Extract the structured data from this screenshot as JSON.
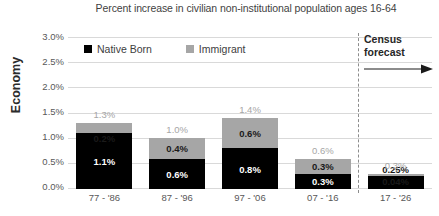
{
  "chart_data": {
    "type": "bar",
    "title": "Percent increase in civilian non-institutional population ages 16-64",
    "xlabel": "",
    "ylabel": "Economy",
    "ylim": [
      0,
      3.0
    ],
    "ytick_labels": [
      "3.0%",
      "2.5%",
      "2.0%",
      "1.5%",
      "1.0%",
      "0.5%",
      "0.0%"
    ],
    "ytick_values": [
      3.0,
      2.5,
      2.0,
      1.5,
      1.0,
      0.5,
      0.0
    ],
    "grid": true,
    "stacked": true,
    "legend_position": "top-left-inside",
    "categories": [
      "77 - '86",
      "87 - '96",
      "97 - '06",
      "07 - '16",
      "17 - '26"
    ],
    "series": [
      {
        "name": "Native Born",
        "color": "#000000",
        "values": [
          1.1,
          0.6,
          0.8,
          0.3,
          0.25
        ],
        "labels": [
          "1.1%",
          "0.6%",
          "0.8%",
          "0.3%",
          "0.25%"
        ]
      },
      {
        "name": "Immigrant",
        "color": "#a6a6a6",
        "values": [
          0.2,
          0.4,
          0.6,
          0.3,
          0.04
        ],
        "labels": [
          "0.2%",
          "0.4%",
          "0.6%",
          "0.3%",
          "0.04%"
        ]
      }
    ],
    "totals": [
      1.3,
      1.0,
      1.4,
      0.6,
      0.3
    ],
    "total_labels": [
      "1.3%",
      "1.0%",
      "1.4%",
      "0.6%",
      "0.3%"
    ],
    "annotations": [
      {
        "name": "census-forecast",
        "line1": "Census",
        "line2": "forecast",
        "arrow": "right-arrow",
        "at_category_index": 4
      }
    ]
  },
  "legend": {
    "items": [
      {
        "label": "Native Born",
        "swatch": "black-square-icon"
      },
      {
        "label": "Immigrant",
        "swatch": "gray-square-icon"
      }
    ]
  }
}
